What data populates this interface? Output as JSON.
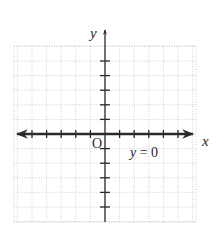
{
  "chart_data": {
    "type": "line",
    "title": "",
    "xlabel": "x",
    "ylabel": "y",
    "origin_label": "O",
    "xlim": [
      -6.2,
      6.2
    ],
    "ylim": [
      -6,
      6.2
    ],
    "grid": true,
    "grid_style": "dotted",
    "x_ticks": [
      -5,
      -4,
      -3,
      -2,
      -1,
      1,
      2,
      3,
      4,
      5
    ],
    "y_ticks": [
      -5,
      -4,
      -3,
      -2,
      -1,
      1,
      2,
      3,
      4,
      5
    ],
    "tick_labels_shown": false,
    "series": [
      {
        "name": "y = 0",
        "equation": "y = 0",
        "x": [
          -6,
          6
        ],
        "y": [
          0,
          0
        ],
        "arrows": "both",
        "style": "bold"
      }
    ],
    "annotations": [
      {
        "text_var": "y",
        "text_rest": " = 0",
        "x": 1.7,
        "y": -1.4
      }
    ]
  },
  "labels": {
    "x_axis": "x",
    "y_axis": "y",
    "origin": "O",
    "equation_var": "y",
    "equation_rest": " = 0"
  },
  "colors": {
    "axis": "#2a2a2a",
    "grid": "#c4c4c4",
    "background": "#ffffff"
  }
}
